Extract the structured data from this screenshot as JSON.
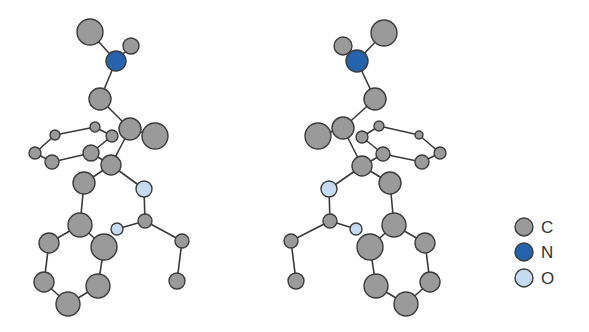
{
  "colors": {
    "C": "#9a9a9a",
    "N": "#2563ad",
    "O": "#c4dbf2"
  },
  "legend": [
    {
      "element": "C",
      "label": "C"
    },
    {
      "element": "N",
      "label": "N"
    },
    {
      "element": "O",
      "label": "O"
    }
  ],
  "molecules": [
    {
      "name": "left-enantiomer",
      "atoms": [
        [
          90,
          32,
          13,
          "C"
        ],
        [
          131,
          46,
          8,
          "C"
        ],
        [
          116,
          61,
          10,
          "N"
        ],
        [
          100,
          99,
          11,
          "C"
        ],
        [
          130,
          129,
          11,
          "C"
        ],
        [
          155,
          136,
          13,
          "C"
        ],
        [
          55,
          135,
          5,
          "C"
        ],
        [
          95,
          127,
          5,
          "C"
        ],
        [
          112,
          136,
          6,
          "C"
        ],
        [
          35,
          153,
          6,
          "C"
        ],
        [
          52,
          162,
          7,
          "C"
        ],
        [
          91,
          153,
          8,
          "C"
        ],
        [
          111,
          165,
          10,
          "C"
        ],
        [
          84,
          183,
          11,
          "C"
        ],
        [
          144,
          189,
          8,
          "O"
        ],
        [
          145,
          221,
          7,
          "C"
        ],
        [
          117,
          229,
          6,
          "O"
        ],
        [
          182,
          241,
          7,
          "C"
        ],
        [
          177,
          281,
          8,
          "C"
        ],
        [
          80,
          225,
          12,
          "C"
        ],
        [
          49,
          243,
          10,
          "C"
        ],
        [
          104,
          247,
          13,
          "C"
        ],
        [
          44,
          282,
          10,
          "C"
        ],
        [
          98,
          286,
          12,
          "C"
        ],
        [
          68,
          304,
          12,
          "C"
        ]
      ],
      "bonds": [
        [
          0,
          2
        ],
        [
          1,
          2
        ],
        [
          2,
          3
        ],
        [
          3,
          4
        ],
        [
          4,
          5
        ],
        [
          4,
          12
        ],
        [
          6,
          7
        ],
        [
          7,
          8
        ],
        [
          8,
          11
        ],
        [
          11,
          10
        ],
        [
          10,
          9
        ],
        [
          9,
          6
        ],
        [
          11,
          12
        ],
        [
          12,
          13
        ],
        [
          12,
          14
        ],
        [
          14,
          15
        ],
        [
          15,
          16
        ],
        [
          15,
          17
        ],
        [
          17,
          18
        ],
        [
          13,
          19
        ],
        [
          19,
          20
        ],
        [
          19,
          21
        ],
        [
          20,
          22
        ],
        [
          22,
          24
        ],
        [
          24,
          23
        ],
        [
          23,
          21
        ]
      ]
    },
    {
      "name": "right-enantiomer",
      "atoms": [
        [
          384,
          33,
          13,
          "C"
        ],
        [
          343,
          46,
          9,
          "C"
        ],
        [
          357,
          61,
          11,
          "N"
        ],
        [
          375,
          99,
          11,
          "C"
        ],
        [
          343,
          128,
          11,
          "C"
        ],
        [
          318,
          136,
          13,
          "C"
        ],
        [
          379,
          126,
          5,
          "C"
        ],
        [
          362,
          137,
          6,
          "C"
        ],
        [
          419,
          135,
          4,
          "C"
        ],
        [
          440,
          153,
          6,
          "C"
        ],
        [
          422,
          162,
          7,
          "C"
        ],
        [
          383,
          154,
          7,
          "C"
        ],
        [
          362,
          166,
          10,
          "C"
        ],
        [
          390,
          183,
          11,
          "C"
        ],
        [
          329,
          189,
          8,
          "O"
        ],
        [
          330,
          221,
          7,
          "C"
        ],
        [
          356,
          229,
          6,
          "O"
        ],
        [
          291,
          241,
          7,
          "C"
        ],
        [
          296,
          281,
          8,
          "C"
        ],
        [
          394,
          225,
          12,
          "C"
        ],
        [
          425,
          243,
          10,
          "C"
        ],
        [
          370,
          247,
          13,
          "C"
        ],
        [
          430,
          282,
          10,
          "C"
        ],
        [
          376,
          286,
          12,
          "C"
        ],
        [
          406,
          304,
          12,
          "C"
        ]
      ],
      "bonds": [
        [
          0,
          2
        ],
        [
          1,
          2
        ],
        [
          2,
          3
        ],
        [
          3,
          4
        ],
        [
          4,
          5
        ],
        [
          4,
          12
        ],
        [
          6,
          7
        ],
        [
          6,
          8
        ],
        [
          8,
          9
        ],
        [
          9,
          10
        ],
        [
          10,
          11
        ],
        [
          11,
          7
        ],
        [
          11,
          12
        ],
        [
          12,
          13
        ],
        [
          12,
          14
        ],
        [
          14,
          15
        ],
        [
          15,
          16
        ],
        [
          15,
          17
        ],
        [
          17,
          18
        ],
        [
          13,
          19
        ],
        [
          19,
          20
        ],
        [
          19,
          21
        ],
        [
          20,
          22
        ],
        [
          22,
          24
        ],
        [
          24,
          23
        ],
        [
          23,
          21
        ]
      ]
    }
  ]
}
